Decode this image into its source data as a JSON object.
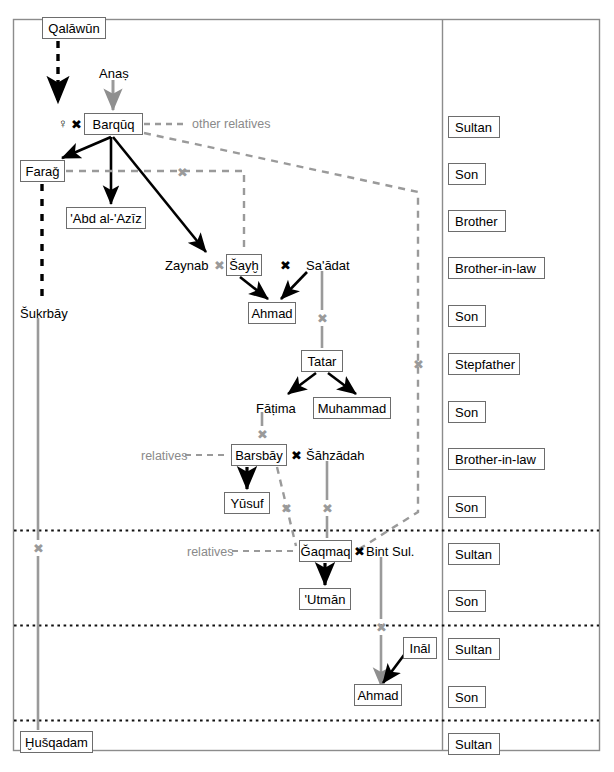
{
  "figure": {
    "caption": "",
    "border_color": "#8c8c8c",
    "colors": {
      "black_line": "#000000",
      "gray_line": "#9a9a9a",
      "box_border": "#6d6d6d",
      "text": "#000000",
      "gray_text": "#8a8a8a"
    }
  },
  "tree": {
    "boxed_persons": [
      {
        "id": "qalawun",
        "name": "Qalāwūn",
        "x": 42,
        "y": 17,
        "w": 64
      },
      {
        "id": "barquq",
        "name": "Barqūq",
        "x": 84,
        "y": 113,
        "w": 59
      },
      {
        "id": "farag",
        "name": "Faraǧ",
        "x": 20,
        "y": 160,
        "w": 45
      },
      {
        "id": "abdalaziz",
        "name": "'Abd al-'Azīz",
        "x": 66,
        "y": 207,
        "w": 80
      },
      {
        "id": "sayh",
        "name": "Šayḫ",
        "x": 226,
        "y": 254,
        "w": 36
      },
      {
        "id": "ahmad1",
        "name": "Ahmad",
        "x": 248,
        "y": 302,
        "w": 48
      },
      {
        "id": "tatar",
        "name": "Tatar",
        "x": 301,
        "y": 350,
        "w": 42
      },
      {
        "id": "muhammad",
        "name": "Muhammad",
        "x": 313,
        "y": 397,
        "w": 78
      },
      {
        "id": "barsbay",
        "name": "Barsbāy",
        "x": 231,
        "y": 444,
        "w": 56
      },
      {
        "id": "yusuf",
        "name": "Yūsuf",
        "x": 224,
        "y": 492,
        "w": 46
      },
      {
        "id": "gaqmaq",
        "name": "Ǧaqmaq",
        "x": 299,
        "y": 540,
        "w": 53
      },
      {
        "id": "utman",
        "name": "'Utmān",
        "x": 299,
        "y": 588,
        "w": 52
      },
      {
        "id": "inal",
        "name": "Ināl",
        "x": 403,
        "y": 637,
        "w": 34
      },
      {
        "id": "ahmad2",
        "name": "Ahmad",
        "x": 354,
        "y": 684,
        "w": 48
      },
      {
        "id": "husqadam",
        "name": "Ḫušqadam",
        "x": 20,
        "y": 731,
        "w": 73
      }
    ],
    "plain_persons": [
      {
        "id": "anas",
        "name": "Anaṣ",
        "x": 99,
        "y": 67
      },
      {
        "id": "zaynab",
        "name": "Zaynab",
        "x": 165,
        "y": 259
      },
      {
        "id": "saadat",
        "name": "Sa'ādat",
        "x": 306,
        "y": 259
      },
      {
        "id": "fatima",
        "name": "Fāṭima",
        "x": 256,
        "y": 402
      },
      {
        "id": "sahzadah",
        "name": "Šāhzādah",
        "x": 306,
        "y": 449
      },
      {
        "id": "bintsul",
        "name": "Bint Sul.",
        "x": 366,
        "y": 545
      },
      {
        "id": "sukrbay",
        "name": "Šukrbāy",
        "x": 20,
        "y": 307
      }
    ],
    "gray_labels": [
      {
        "id": "other-relatives",
        "text": "other relatives",
        "x": 192,
        "y": 118
      },
      {
        "id": "relatives-1",
        "text": "relatives",
        "x": 141,
        "y": 450
      },
      {
        "id": "relatives-2",
        "text": "relatives",
        "x": 187,
        "y": 546
      }
    ],
    "symbols": [
      {
        "id": "female-symbol",
        "glyph": "♀",
        "x": 58,
        "y": 118,
        "color": "black"
      },
      {
        "id": "marriage-barquq",
        "glyph": "✖",
        "x": 71,
        "y": 118,
        "color": "black"
      },
      {
        "id": "marriage-zaynab",
        "glyph": "✖",
        "x": 214,
        "y": 259,
        "color": "gray"
      },
      {
        "id": "marriage-sayh",
        "glyph": "✖",
        "x": 280,
        "y": 259,
        "color": "black"
      },
      {
        "id": "marriage-farag",
        "glyph": "✖",
        "x": 177,
        "y": 167,
        "color": "gray"
      },
      {
        "id": "marriage-saadat",
        "glyph": "✖",
        "x": 319,
        "y": 313,
        "color": "gray"
      },
      {
        "id": "marriage-fatima",
        "glyph": "✖",
        "x": 256,
        "y": 429,
        "color": "gray"
      },
      {
        "id": "marriage-barsbay",
        "glyph": "✖",
        "x": 291,
        "y": 449,
        "color": "black"
      },
      {
        "id": "marriage-yusuf",
        "glyph": "✖",
        "x": 282,
        "y": 503,
        "color": "gray"
      },
      {
        "id": "marriage-sahzadah",
        "glyph": "✖",
        "x": 321,
        "y": 503,
        "color": "gray"
      },
      {
        "id": "marriage-gaqmaq",
        "glyph": "✖",
        "x": 354,
        "y": 545,
        "color": "black"
      },
      {
        "id": "marriage-bintsul",
        "glyph": "✖",
        "x": 374,
        "y": 622,
        "color": "gray"
      },
      {
        "id": "marriage-right",
        "glyph": "✖",
        "x": 414,
        "y": 359,
        "color": "gray"
      },
      {
        "id": "marriage-sukrbay",
        "glyph": "✖",
        "x": 33,
        "y": 543,
        "color": "gray"
      }
    ]
  },
  "roles": {
    "column_x": 448,
    "items": [
      {
        "label": "Sultan",
        "y": 116,
        "w": 52
      },
      {
        "label": "Son",
        "y": 163,
        "w": 38
      },
      {
        "label": "Brother",
        "y": 210,
        "w": 58
      },
      {
        "label": "Brother-in-law",
        "y": 257,
        "w": 97
      },
      {
        "label": "Son",
        "y": 305,
        "w": 38
      },
      {
        "label": "Stepfather",
        "y": 353,
        "w": 72
      },
      {
        "label": "Son",
        "y": 401,
        "w": 38
      },
      {
        "label": "Brother-in-law",
        "y": 448,
        "w": 97
      },
      {
        "label": "Son",
        "y": 496,
        "w": 38
      },
      {
        "label": "Sultan",
        "y": 543,
        "w": 52
      },
      {
        "label": "Son",
        "y": 590,
        "w": 38
      },
      {
        "label": "Sultan",
        "y": 638,
        "w": 52
      },
      {
        "label": "Son",
        "y": 686,
        "w": 38
      },
      {
        "label": "Sultan",
        "y": 733,
        "w": 52
      }
    ],
    "separators_y": [
      530,
      625,
      720
    ]
  }
}
